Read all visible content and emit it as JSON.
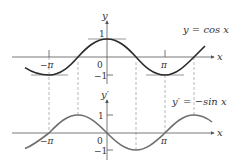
{
  "figure": {
    "top_graph": {
      "equation_label": "y = cos x",
      "y_axis_label": "y",
      "x_axis_label": "x",
      "ticks": {
        "neg_pi": "−π",
        "pi": "π",
        "zero": "0",
        "one": "1",
        "neg_one": "−1"
      }
    },
    "bottom_graph": {
      "equation_label": "y′ = −sin x",
      "y_axis_label": "y′",
      "x_axis_label": "x",
      "ticks": {
        "neg_pi": "−π",
        "pi": "π",
        "zero": "0",
        "one": "1",
        "neg_one": "−1"
      }
    },
    "colors": {
      "curve_top": "#2a2a2a",
      "curve_bottom": "#6e6e6e",
      "axis": "#555555",
      "tangent": "#8a8a8a",
      "dashed": "#9a9a9a",
      "text": "#333333"
    }
  }
}
